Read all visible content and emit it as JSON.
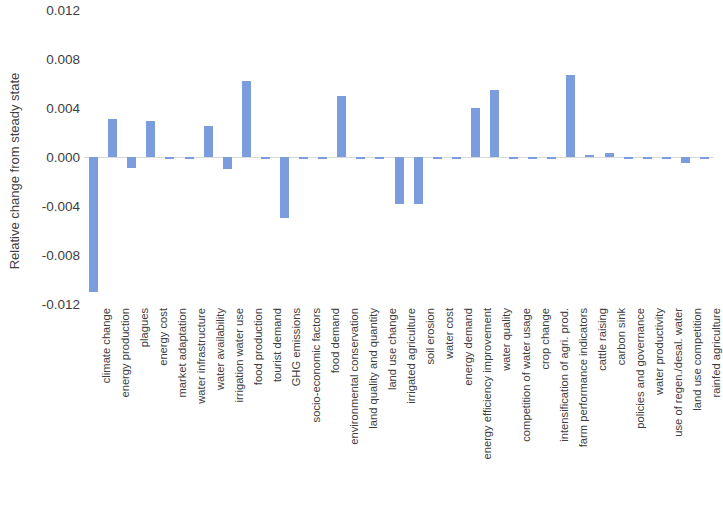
{
  "chart_data": {
    "type": "bar",
    "title": "",
    "xlabel": "",
    "ylabel": "Relative change from steady state",
    "ylim": [
      -0.012,
      0.012
    ],
    "ytick_labels": [
      "0.012",
      "0.008",
      "0.004",
      "0.000",
      "-0.004",
      "-0.008",
      "-0.012"
    ],
    "ytick_values": [
      0.012,
      0.008,
      0.004,
      0.0,
      -0.004,
      -0.008,
      -0.012
    ],
    "grid": false,
    "legend": null,
    "bar_color": "#7b9ddd",
    "categories": [
      "climate change",
      "energy production",
      "plagues",
      "energy cost",
      "market adaptation",
      "water infrastructure",
      "water availability",
      "irrigation water use",
      "food production",
      "tourist demand",
      "GHG emissions",
      "socio-economic factors",
      "food demand",
      "environmental conservation",
      "land quality and quantity",
      "land use change",
      "irrigated agriculture",
      "soil erosion",
      "water cost",
      "energy demand",
      "energy efficiency improvement",
      "water quality",
      "competition of water usage",
      "crop change",
      "intensification of agri. prod.",
      "farm performance indicators",
      "cattle raising",
      "carbon sink",
      "policies and governance",
      "water productivity",
      "use of regen./desal. water",
      "land use competition",
      "rainfed agriculture"
    ],
    "values": [
      -0.011,
      0.0031,
      -0.0009,
      0.0029,
      0.0,
      0.0,
      0.0025,
      -0.001,
      0.0062,
      0.0,
      -0.005,
      0.0,
      0.0,
      0.005,
      0.0,
      0.0,
      -0.0038,
      -0.0038,
      -0.0002,
      0.0,
      0.004,
      0.0055,
      0.0,
      0.0,
      0.0,
      0.0067,
      0.0002,
      0.0003,
      0.0,
      0.0,
      0.0,
      -0.0005,
      0.0
    ]
  }
}
